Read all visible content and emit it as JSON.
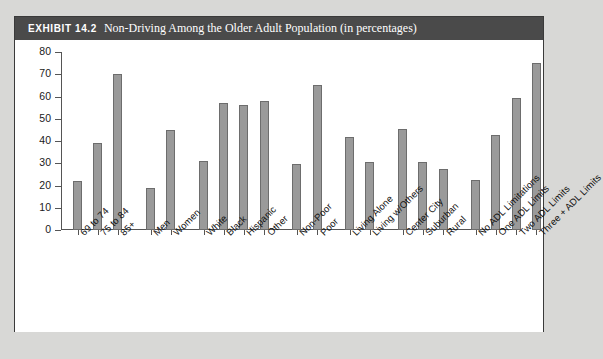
{
  "exhibit": {
    "number": "EXHIBIT 14.2",
    "title": "Non-Driving Among the Older Adult Population (in percentages)"
  },
  "colors": {
    "header_bg": "#4a4a4a",
    "header_text": "#ffffff",
    "bar_fill": "#9a9a9a",
    "bar_border": "#6d6d6d",
    "axis": "#555555",
    "page_bg": "#d8d8d6",
    "panel_bg": "#ffffff"
  },
  "chart_data": {
    "type": "bar",
    "title": "Non-Driving Among the Older Adult Population (in percentages)",
    "xlabel": "",
    "ylabel": "",
    "ylim": [
      0,
      80
    ],
    "yticks": [
      0,
      10,
      20,
      30,
      40,
      50,
      60,
      70,
      80
    ],
    "grid": false,
    "legend": "none",
    "categories": [
      "69 to 74",
      "75 to 84",
      "85+",
      "Men",
      "Women",
      "White",
      "Black",
      "Hispanic",
      "Other",
      "Non-Poor",
      "Poor",
      "Living Alone",
      "Living w/Others",
      "Center City",
      "Suburban",
      "Rural",
      "No ADL Limitations",
      "One ADL Limits",
      "Two ADL Limits",
      "Three + ADL Limits"
    ],
    "values": [
      22,
      39,
      70,
      19,
      45,
      31,
      57,
      56,
      58,
      29.5,
      65,
      42,
      30.5,
      45.5,
      30.5,
      27.5,
      22.5,
      42.5,
      59.5,
      75
    ],
    "groups": [
      {
        "name": "Age",
        "categories": [
          "69 to 74",
          "75 to 84",
          "85+"
        ]
      },
      {
        "name": "Sex",
        "categories": [
          "Men",
          "Women"
        ]
      },
      {
        "name": "Race/Ethnicity",
        "categories": [
          "White",
          "Black",
          "Hispanic",
          "Other"
        ]
      },
      {
        "name": "Poverty Status",
        "categories": [
          "Non-Poor",
          "Poor"
        ]
      },
      {
        "name": "Living Arrangement",
        "categories": [
          "Living Alone",
          "Living w/Others"
        ]
      },
      {
        "name": "Residence",
        "categories": [
          "Center City",
          "Suburban",
          "Rural"
        ]
      },
      {
        "name": "ADL Limitations",
        "categories": [
          "No ADL Limitations",
          "One ADL Limits",
          "Two ADL Limits",
          "Three + ADL Limits"
        ]
      }
    ]
  }
}
